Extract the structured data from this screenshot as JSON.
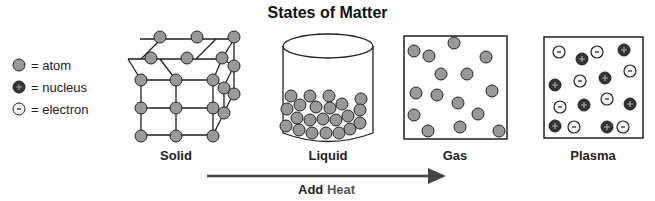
{
  "title": "States of Matter",
  "legend": [
    {
      "symbol": "atom",
      "label": "= atom",
      "fill": "#999999"
    },
    {
      "symbol": "nucleus",
      "label": "= nucleus",
      "fill": "#333333",
      "sign": "+"
    },
    {
      "symbol": "electron",
      "label": "= electron",
      "fill": "#f2f2f2",
      "sign": "-"
    }
  ],
  "states": [
    {
      "name": "solid",
      "label": "Solid"
    },
    {
      "name": "liquid",
      "label": "Liquid"
    },
    {
      "name": "gas",
      "label": "Gas"
    },
    {
      "name": "plasma",
      "label": "Plasma"
    }
  ],
  "arrow": {
    "label_bold": "Add",
    "label_rest": "Heat"
  },
  "colors": {
    "atom": "#999999",
    "nucleus": "#333333",
    "electron": "#f2f2f2",
    "stroke": "#222222",
    "arrow": "#444444"
  }
}
